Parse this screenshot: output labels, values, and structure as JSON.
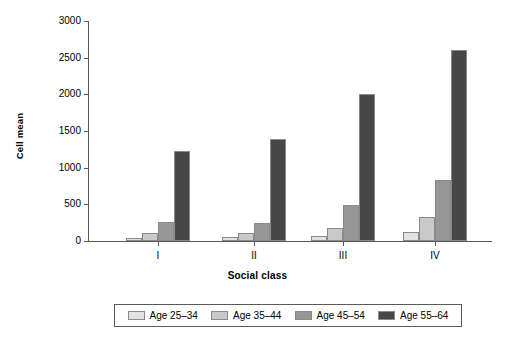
{
  "chart_data": {
    "type": "bar",
    "title": "",
    "xlabel": "Social class",
    "ylabel": "Cell mean",
    "categories": [
      "I",
      "II",
      "III",
      "IV"
    ],
    "ylim": [
      0,
      3000
    ],
    "yticks": [
      0,
      500,
      1000,
      1500,
      2000,
      2500,
      3000
    ],
    "ytick_labels": [
      "0",
      "500",
      "1000",
      "1500",
      "2000",
      "2500",
      "3000"
    ],
    "grid": false,
    "legend_position": "bottom",
    "series": [
      {
        "name": "Age 25–34",
        "color": "#e2e2e2",
        "values": [
          45,
          50,
          70,
          120
        ]
      },
      {
        "name": "Age 35–44",
        "color": "#c9c9c9",
        "values": [
          110,
          115,
          180,
          330
        ]
      },
      {
        "name": "Age 45–54",
        "color": "#969696",
        "values": [
          265,
          250,
          495,
          835
        ]
      },
      {
        "name": "Age 55–64",
        "color": "#474747",
        "values": [
          1230,
          1385,
          2005,
          2605
        ]
      }
    ]
  },
  "axis": {
    "y_title": "Cell mean",
    "x_title": "Social class"
  },
  "colors": {
    "axis": "#595959",
    "bar_border": "#8a8a8a",
    "legend_border": "#5a5a5a",
    "background": "#ffffff"
  }
}
